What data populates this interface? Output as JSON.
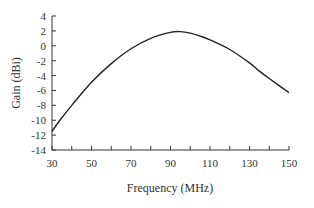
{
  "chart_data": {
    "type": "line",
    "title": "",
    "xlabel": "Frequency (MHz)",
    "ylabel": "Gain (dBi)",
    "xlim": [
      30,
      150
    ],
    "ylim": [
      -14,
      4
    ],
    "grid": false,
    "legend": null,
    "x_ticks": [
      30,
      50,
      70,
      90,
      110,
      130,
      150
    ],
    "x_minor_ticks": [
      40,
      60,
      80,
      100,
      120,
      140
    ],
    "y_ticks": [
      4,
      2,
      0,
      -2,
      -4,
      -6,
      -8,
      -10,
      -12,
      -14
    ],
    "x_tick_labels": [
      "30",
      "50",
      "70",
      "90",
      "110",
      "130",
      "150"
    ],
    "y_tick_labels": [
      "4",
      "2",
      "0",
      "-2",
      "-4",
      "-6",
      "-8",
      "-10",
      "-12",
      "-14"
    ],
    "series": [
      {
        "name": "Gain",
        "color": "#222222",
        "x": [
          30,
          34,
          40,
          50,
          60,
          70,
          80,
          90,
          95,
          100,
          105,
          110,
          120,
          130,
          135,
          140,
          150
        ],
        "y": [
          -11.5,
          -10.0,
          -8.0,
          -4.9,
          -2.4,
          -0.4,
          1.0,
          1.8,
          1.9,
          1.7,
          1.3,
          0.8,
          -0.5,
          -2.3,
          -3.4,
          -4.4,
          -6.3
        ]
      }
    ]
  },
  "axes": {
    "x_title": "Frequency (MHz)",
    "y_title": "Gain (dBi)"
  }
}
